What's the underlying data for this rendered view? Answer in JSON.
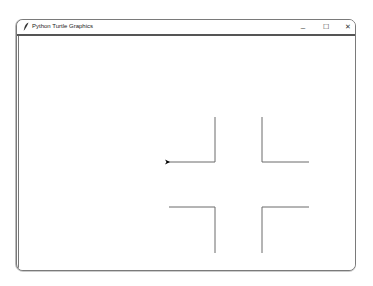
{
  "window": {
    "title": "Python Turtle Graphics",
    "app_icon": "feather-icon",
    "controls": {
      "minimize": "–",
      "maximize": "☐",
      "close": "✕"
    }
  },
  "canvas": {
    "background": "#ffffff",
    "line_color": "#6b6b6b",
    "turtle_color": "#000000",
    "turtle_shape": "arrow",
    "turtle_heading": "right",
    "segments": [
      {
        "x1": 215,
        "y1": 117,
        "x2": 215,
        "y2": 162
      },
      {
        "x1": 215,
        "y1": 162,
        "x2": 168,
        "y2": 162
      },
      {
        "x1": 262,
        "y1": 117,
        "x2": 262,
        "y2": 162
      },
      {
        "x1": 262,
        "y1": 162,
        "x2": 309,
        "y2": 162
      },
      {
        "x1": 169,
        "y1": 207,
        "x2": 215,
        "y2": 207
      },
      {
        "x1": 215,
        "y1": 207,
        "x2": 215,
        "y2": 253
      },
      {
        "x1": 262,
        "y1": 253,
        "x2": 262,
        "y2": 207
      },
      {
        "x1": 262,
        "y1": 207,
        "x2": 309,
        "y2": 207
      }
    ],
    "turtle": {
      "x": 170,
      "y": 162
    }
  }
}
